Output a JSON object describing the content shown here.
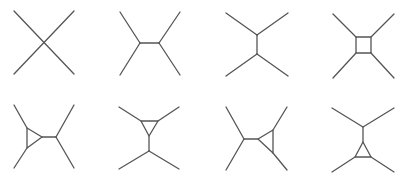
{
  "style": {
    "stroke": "#555555",
    "stroke_width": 1.3,
    "background": "#ffffff"
  },
  "diagrams": [
    {
      "id": "tree-contact",
      "lines": [
        [
          14,
          11,
          74,
          74
        ],
        [
          74,
          11,
          14,
          74
        ]
      ],
      "polygons": []
    },
    {
      "id": "tree-s-channel",
      "lines": [
        [
          120,
          12,
          140,
          43
        ],
        [
          120,
          75,
          140,
          43
        ],
        [
          140,
          43,
          159,
          43
        ],
        [
          159,
          43,
          180,
          12
        ],
        [
          159,
          43,
          180,
          75
        ]
      ],
      "polygons": []
    },
    {
      "id": "tree-t-channel",
      "lines": [
        [
          226,
          13,
          257,
          35
        ],
        [
          288,
          13,
          257,
          35
        ],
        [
          257,
          35,
          257,
          54
        ],
        [
          257,
          54,
          226,
          76
        ],
        [
          257,
          54,
          288,
          76
        ]
      ],
      "polygons": []
    },
    {
      "id": "box",
      "lines": [
        [
          333,
          14,
          356,
          37
        ],
        [
          394,
          14,
          371,
          37
        ],
        [
          333,
          78,
          356,
          53
        ],
        [
          394,
          78,
          371,
          53
        ]
      ],
      "polygons": [
        [
          [
            356,
            37
          ],
          [
            371,
            37
          ],
          [
            371,
            53
          ],
          [
            356,
            53
          ]
        ]
      ]
    },
    {
      "id": "triangle-left",
      "lines": [
        [
          14,
          105,
          27,
          128
        ],
        [
          14,
          168,
          27,
          148
        ],
        [
          42,
          137,
          56,
          137
        ],
        [
          56,
          137,
          74,
          105
        ],
        [
          56,
          137,
          74,
          168
        ]
      ],
      "polygons": [
        [
          [
            27,
            128
          ],
          [
            27,
            148
          ],
          [
            42,
            137
          ]
        ]
      ]
    },
    {
      "id": "triangle-top",
      "lines": [
        [
          119,
          107,
          141,
          121
        ],
        [
          179,
          107,
          158,
          121
        ],
        [
          149,
          136,
          149,
          151
        ],
        [
          149,
          151,
          119,
          169
        ],
        [
          149,
          151,
          179,
          169
        ]
      ],
      "polygons": [
        [
          [
            141,
            121
          ],
          [
            158,
            121
          ],
          [
            149,
            136
          ]
        ]
      ]
    },
    {
      "id": "triangle-right",
      "lines": [
        [
          226,
          107,
          244,
          139
        ],
        [
          226,
          170,
          244,
          139
        ],
        [
          244,
          139,
          258,
          139
        ],
        [
          273,
          130,
          287,
          107
        ],
        [
          273,
          153,
          287,
          170
        ]
      ],
      "polygons": [
        [
          [
            258,
            139
          ],
          [
            273,
            130
          ],
          [
            273,
            153
          ]
        ]
      ]
    },
    {
      "id": "triangle-bottom",
      "lines": [
        [
          332,
          108,
          363,
          127
        ],
        [
          394,
          108,
          363,
          127
        ],
        [
          363,
          127,
          363,
          142
        ],
        [
          355,
          157,
          332,
          172
        ],
        [
          371,
          157,
          394,
          172
        ]
      ],
      "polygons": [
        [
          [
            363,
            142
          ],
          [
            355,
            157
          ],
          [
            371,
            157
          ]
        ]
      ]
    }
  ]
}
